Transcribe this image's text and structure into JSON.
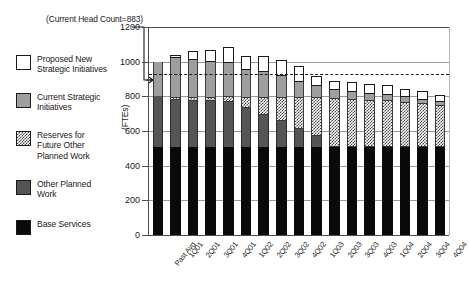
{
  "callout": {
    "text": "(Current\nHead Count=883)",
    "value": 883
  },
  "legend": {
    "items": [
      {
        "key": "new",
        "swatch": "white-square-icon",
        "label": "Proposed New\nStrategic Initiatives",
        "color": "#ffffff"
      },
      {
        "key": "current",
        "swatch": "light-gray-square-icon",
        "label": "Current Strategic\nInitiatives",
        "color": "#9e9e9e"
      },
      {
        "key": "reserve",
        "swatch": "checkered-square-icon",
        "label": "Reserves for\nFuture Other\nPlanned Work",
        "color": "#4a4a4a"
      },
      {
        "key": "other",
        "swatch": "dark-gray-square-icon",
        "label": "Other Planned\nWork",
        "color": "#555555"
      },
      {
        "key": "base",
        "swatch": "black-square-icon",
        "label": "Base Services",
        "color": "#0a0a0a"
      }
    ]
  },
  "chart_data": {
    "type": "bar",
    "stacked": true,
    "title": "",
    "xlabel": "",
    "ylabel": "(FTEs)",
    "ylim": [
      0,
      1200
    ],
    "yticks": [
      0,
      200,
      400,
      600,
      800,
      1000,
      1200
    ],
    "ytick_labels": [
      "0",
      "200",
      "400",
      "600",
      "800",
      "1000",
      "1200"
    ],
    "grid": true,
    "legend_position": "left-outside",
    "categories": [
      "Past Avg",
      "1Q01",
      "2Q01",
      "3Q01",
      "4Q01",
      "1Q02",
      "2Q02",
      "3Q02",
      "4Q02",
      "1Q03",
      "2Q03",
      "3Q03",
      "4Q03",
      "1Q04",
      "2Q04",
      "3Q04",
      "4Q04"
    ],
    "series": [
      {
        "name": "Base Services",
        "color": "#0a0a0a",
        "values": [
          510,
          510,
          510,
          510,
          510,
          510,
          510,
          510,
          510,
          510,
          510,
          510,
          510,
          510,
          510,
          510,
          510
        ]
      },
      {
        "name": "Other Planned Work",
        "color": "#555555",
        "values": [
          290,
          270,
          265,
          265,
          255,
          225,
          185,
          145,
          100,
          60,
          0,
          0,
          0,
          0,
          0,
          0,
          0
        ]
      },
      {
        "name": "Reserves for Future Other Planned Work",
        "color": "#4a4a4a",
        "values": [
          0,
          15,
          20,
          20,
          35,
          60,
          100,
          140,
          185,
          225,
          280,
          275,
          270,
          270,
          260,
          250,
          240
        ]
      },
      {
        "name": "Current Strategic Initiatives",
        "color": "#9e9e9e",
        "values": [
          200,
          225,
          215,
          205,
          195,
          155,
          145,
          125,
          90,
          65,
          45,
          40,
          35,
          30,
          25,
          20,
          15
        ]
      },
      {
        "name": "Proposed New Strategic Initiatives",
        "color": "#ffffff",
        "values": [
          0,
          20,
          50,
          65,
          90,
          85,
          90,
          90,
          90,
          55,
          55,
          55,
          55,
          55,
          50,
          50,
          45
        ]
      }
    ],
    "totals": [
      1000,
      1040,
      1060,
      1065,
      1085,
      1035,
      1030,
      1010,
      975,
      915,
      890,
      880,
      870,
      865,
      845,
      830,
      810
    ],
    "reference_line": {
      "label": "Current Head Count",
      "value": 930,
      "style": "dashed"
    }
  }
}
